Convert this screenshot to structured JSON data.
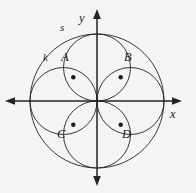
{
  "figure": {
    "kind": "geometry-diagram",
    "background_color": "#f4f4f4",
    "ink_color": "#232323"
  },
  "axes": {
    "x_label": "x",
    "y_label": "y",
    "origin": {
      "x": 97,
      "y": 101
    },
    "x_axis": {
      "start_x": 5,
      "end_x": 182,
      "y": 101
    },
    "y_axis": {
      "top_y": 9,
      "bottom_y": 186,
      "x": 97
    },
    "arrow_names": [
      "x-axis-arrow-right",
      "x-axis-arrow-left",
      "y-axis-arrow-up",
      "y-axis-arrow-down"
    ]
  },
  "curves": [
    {
      "name": "outer-circle",
      "label": "s",
      "cx": 97,
      "cy": 101,
      "r": 67,
      "label_x": 60,
      "label_y": 22
    },
    {
      "name": "petal-circle-left",
      "label": "k",
      "cx": 63.5,
      "cy": 101,
      "r": 33.5,
      "label_x": 43,
      "label_y": 52
    },
    {
      "name": "petal-circle-right",
      "label": "",
      "cx": 130.5,
      "cy": 101,
      "r": 33.5,
      "label_x": 0,
      "label_y": 0
    },
    {
      "name": "petal-circle-top",
      "label": "",
      "cx": 97,
      "cy": 67.5,
      "r": 33.5,
      "label_x": 0,
      "label_y": 0
    },
    {
      "name": "petal-circle-bottom",
      "label": "",
      "cx": 97,
      "cy": 134.5,
      "r": 33.5,
      "label_x": 0,
      "label_y": 0
    }
  ],
  "points": [
    {
      "name": "point-a",
      "label": "A",
      "x": 73.3,
      "y": 77.3,
      "label_x": 61,
      "label_y": 52
    },
    {
      "name": "point-b",
      "label": "B",
      "x": 120.7,
      "y": 77.3,
      "label_x": 124,
      "label_y": 52
    },
    {
      "name": "point-c",
      "label": "C",
      "x": 73.3,
      "y": 124.7,
      "label_x": 58,
      "label_y": 131
    },
    {
      "name": "point-d",
      "label": "D",
      "x": 120.7,
      "y": 124.7,
      "label_x": 122,
      "label_y": 131
    }
  ],
  "labels": {
    "outer_circle": "s",
    "petal_circle": "k",
    "axis_x": "x",
    "axis_y": "y",
    "point_a": "A",
    "point_b": "B",
    "point_c": "C",
    "point_d": "D"
  }
}
